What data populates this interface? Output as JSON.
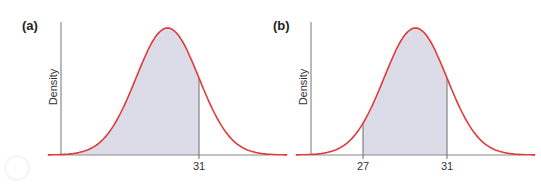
{
  "chart_data": [
    {
      "type": "area",
      "panel": "(a)",
      "title": "(a)",
      "xlabel": "",
      "ylabel": "Density",
      "distribution": "normal",
      "mean_est": 29.5,
      "sd_est": 1.5,
      "x_ticks": [
        31
      ],
      "shaded_region": {
        "from": null,
        "to": 31,
        "description": "area to the left of 31"
      },
      "grid": false,
      "colors": {
        "curve": "#e03a3a",
        "fill": "#dcdce8",
        "axis": "#8a8a8a"
      }
    },
    {
      "type": "area",
      "panel": "(b)",
      "title": "(b)",
      "xlabel": "",
      "ylabel": "Density",
      "distribution": "normal",
      "mean_est": 29.5,
      "sd_est": 1.5,
      "x_ticks": [
        27,
        31
      ],
      "shaded_region": {
        "from": 27,
        "to": 31,
        "description": "area between 27 and 31"
      },
      "grid": false,
      "colors": {
        "curve": "#e03a3a",
        "fill": "#dcdce8",
        "axis": "#8a8a8a"
      }
    }
  ],
  "panels": {
    "a": {
      "label": "(a)",
      "ylabel": "Density",
      "ticks": [
        "31"
      ]
    },
    "b": {
      "label": "(b)",
      "ylabel": "Density",
      "ticks": [
        "27",
        "31"
      ]
    }
  }
}
